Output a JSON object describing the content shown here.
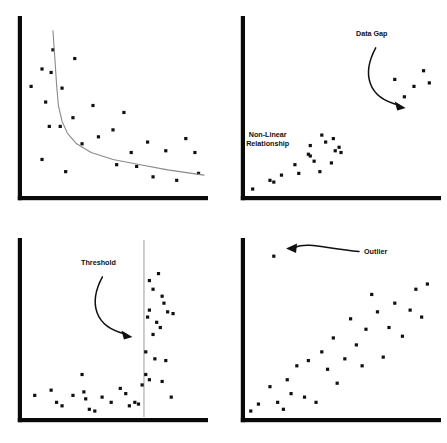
{
  "figure": {
    "title": "",
    "background_color": "#ffffff",
    "axis_color": "#0a0a0a",
    "point_color": "#111111",
    "curve_color": "#8a8a8a",
    "threshold_line_color": "#c8c8c8",
    "annotation_color": "#101010",
    "panel_count": 4,
    "width": 447,
    "height": 443
  },
  "chart_data": [
    {
      "type": "scatter",
      "panel": "top-left",
      "title": "Non-Linear Relationship",
      "annotations": [
        {
          "text": "Non-Linear Relationship",
          "lines": [
            "Non-Linear",
            "Relationship"
          ],
          "x": 135,
          "y": 34
        }
      ],
      "xlabel": "",
      "ylabel": "",
      "xlim": [
        0,
        100
      ],
      "ylim": [
        0,
        100
      ],
      "grid": false,
      "legend": null,
      "series": [
        {
          "name": "observations",
          "marker": "square-dot",
          "x": [
            17,
            11,
            16,
            5,
            13,
            29,
            22,
            21,
            15,
            39,
            11,
            28,
            50,
            56,
            33,
            24,
            42,
            60,
            69,
            52,
            79,
            90,
            63,
            72,
            95,
            85,
            97
          ],
          "y": [
            84,
            73,
            71,
            63,
            54,
            79,
            62,
            40,
            40,
            52,
            21,
            45,
            38,
            48,
            30,
            14,
            34,
            25,
            31,
            18,
            26,
            33,
            17,
            11,
            25,
            9,
            13
          ]
        },
        {
          "name": "fitted-decay-curve",
          "marker": "line",
          "comment": "monotone decreasing power/decay curve crossing near (20,45) and flattening toward (100,12)",
          "x": [
            17,
            18,
            19,
            20,
            22,
            25,
            30,
            38,
            50,
            65,
            80,
            100
          ],
          "y": [
            95,
            80,
            64,
            52,
            43,
            36,
            30,
            25,
            21,
            18,
            15,
            12
          ]
        }
      ]
    },
    {
      "type": "scatter",
      "panel": "top-right",
      "title": "Data Gap",
      "annotations": [
        {
          "text": "Data Gap",
          "lines": [
            "Data Gap"
          ],
          "x": 66,
          "y": 92,
          "arrow": "curved-down-right"
        }
      ],
      "xlabel": "",
      "ylabel": "",
      "xlim": [
        0,
        100
      ],
      "ylim": [
        0,
        100
      ],
      "grid": false,
      "legend": null,
      "series": [
        {
          "name": "lower-cluster",
          "marker": "square-dot",
          "x": [
            4,
            13,
            15,
            19,
            26,
            28,
            33,
            34,
            34,
            36,
            39,
            40,
            42,
            45,
            46,
            47,
            49,
            50
          ],
          "y": [
            4,
            9,
            8,
            12,
            18,
            13,
            24,
            23,
            29,
            20,
            14,
            35,
            31,
            19,
            33,
            26,
            28,
            25
          ]
        },
        {
          "name": "upper-cluster",
          "marker": "square-dot",
          "x": [
            78,
            83,
            88,
            93,
            96
          ],
          "y": [
            67,
            57,
            63,
            72,
            65
          ]
        }
      ]
    },
    {
      "type": "scatter",
      "panel": "bottom-left",
      "title": "Threshold",
      "annotations": [
        {
          "text": "Threshold",
          "lines": [
            "Threshold"
          ],
          "x": 42,
          "y": 88,
          "arrow": "curved-down-right"
        }
      ],
      "xlabel": "",
      "ylabel": "",
      "xlim": [
        0,
        100
      ],
      "ylim": [
        0,
        100
      ],
      "grid": false,
      "legend": null,
      "threshold": {
        "value": 67,
        "orientation": "vertical",
        "label": "Threshold"
      },
      "series": [
        {
          "name": "below-threshold",
          "marker": "square-dot",
          "x": [
            7,
            16,
            19,
            22,
            28,
            33,
            34,
            35,
            37,
            40,
            44,
            49,
            54,
            57,
            59,
            62,
            64,
            66
          ],
          "y": [
            13,
            16,
            9,
            7,
            13,
            25,
            15,
            11,
            5,
            4,
            12,
            9,
            17,
            14,
            7,
            9,
            8,
            19
          ]
        },
        {
          "name": "above-threshold",
          "marker": "square-dot",
          "x": [
            70,
            72,
            70,
            69,
            75,
            77,
            74,
            78,
            80,
            72,
            76,
            83,
            68,
            73,
            79,
            68,
            70,
            77,
            82
          ],
          "y": [
            79,
            74,
            62,
            58,
            83,
            70,
            55,
            66,
            61,
            48,
            52,
            60,
            38,
            34,
            33,
            25,
            22,
            21,
            12
          ]
        }
      ]
    },
    {
      "type": "scatter",
      "panel": "bottom-right",
      "title": "Outlier",
      "annotations": [
        {
          "text": "Outlier",
          "lines": [
            "Outlier"
          ],
          "x": 62,
          "y": 94,
          "arrow": "curved-left"
        }
      ],
      "xlabel": "",
      "ylabel": "",
      "xlim": [
        0,
        100
      ],
      "ylim": [
        0,
        100
      ],
      "grid": false,
      "legend": null,
      "series": [
        {
          "name": "outlier",
          "marker": "square-dot",
          "x": [
            15
          ],
          "y": [
            93
          ]
        },
        {
          "name": "positive-trend",
          "marker": "square-dot",
          "x": [
            3,
            7,
            13,
            17,
            20,
            22,
            24,
            27,
            31,
            33,
            37,
            40,
            43,
            46,
            48,
            52,
            55,
            58,
            61,
            63,
            66,
            69,
            72,
            75,
            78,
            82,
            86,
            89,
            92,
            95
          ],
          "y": [
            4,
            8,
            18,
            9,
            5,
            22,
            14,
            30,
            12,
            33,
            9,
            38,
            28,
            46,
            20,
            34,
            57,
            42,
            30,
            51,
            71,
            61,
            35,
            52,
            66,
            47,
            62,
            74,
            58,
            77
          ]
        }
      ]
    }
  ]
}
